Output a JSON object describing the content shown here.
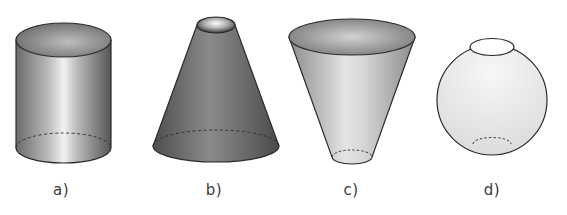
{
  "figure": {
    "shapes": [
      {
        "id": "a",
        "label": "a)",
        "kind": "cylinder",
        "label_x": 61
      },
      {
        "id": "b",
        "label": "b)",
        "kind": "truncated-cone",
        "label_x": 214
      },
      {
        "id": "c",
        "label": "c)",
        "kind": "inverted-truncated-cone",
        "label_x": 351
      },
      {
        "id": "d",
        "label": "d)",
        "kind": "sphere-with-truncated-caps",
        "label_x": 492
      }
    ],
    "colors": {
      "outline": "#2a2a2a",
      "dark_gray": "#5e5e5e",
      "mid_gray": "#a0a0a0",
      "light_gray": "#e6e6e6",
      "highlight": "#ffffff",
      "background": "#ffffff"
    }
  }
}
